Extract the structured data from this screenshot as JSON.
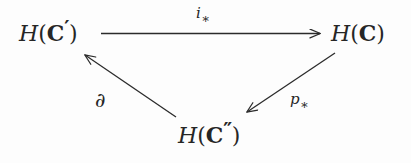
{
  "diagram": {
    "type": "commutative-triangle",
    "ink_color": "#262626",
    "background_color": "#fdfdfd",
    "nodes": [
      {
        "id": "left",
        "functor": "H",
        "open_paren": "(",
        "object": "C",
        "prime": "′",
        "close_paren": ")",
        "full_text": "H(C′)"
      },
      {
        "id": "right",
        "functor": "H",
        "open_paren": "(",
        "object": "C",
        "prime": "",
        "close_paren": ")",
        "full_text": "H(C)"
      },
      {
        "id": "bottom",
        "functor": "H",
        "open_paren": "(",
        "object": "C",
        "prime": "″",
        "close_paren": ")",
        "full_text": "H(C″)"
      }
    ],
    "arrows": [
      {
        "id": "i-star",
        "from": "left",
        "to": "right",
        "label_base": "i",
        "label_sub": "∗",
        "label_text": "i∗"
      },
      {
        "id": "p-star",
        "from": "right",
        "to": "bottom",
        "label_base": "p",
        "label_sub": "∗",
        "label_text": "p∗"
      },
      {
        "id": "partial",
        "from": "bottom",
        "to": "left",
        "label_base": "∂",
        "label_sub": "",
        "label_text": "∂"
      }
    ]
  }
}
